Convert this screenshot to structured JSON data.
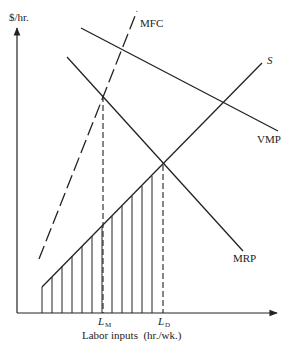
{
  "diagram": {
    "type": "economics-labor-market",
    "y_axis_label": "$/hr.",
    "x_axis_label": "Labor inputs  (hr./wk.)",
    "curves": {
      "mfc": {
        "label": "MFC",
        "style": "dashed"
      },
      "s": {
        "label": "S",
        "style": "solid"
      },
      "vmp": {
        "label": "VMP",
        "style": "solid"
      },
      "mrp": {
        "label": "MRP",
        "style": "solid"
      }
    },
    "x_ticks": {
      "lm": {
        "main": "L",
        "sub": "M"
      },
      "ld": {
        "main": "L",
        "sub": "D"
      }
    },
    "shaded_region": "vertical hatching under S from origin to L_D",
    "colors": {
      "ink": "#222222",
      "background": "#ffffff"
    }
  }
}
